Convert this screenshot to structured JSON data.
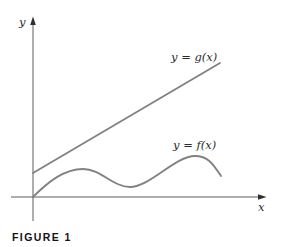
{
  "figure": {
    "caption": "FIGURE 1",
    "labels": {
      "y_axis": "y",
      "x_axis": "x",
      "g_curve": "y = g(x)",
      "f_curve": "y = f(x)"
    },
    "colors": {
      "background": "#ffffff",
      "axis": "#4a4a4a",
      "arrow": "#2e2e2e",
      "curve": "#818181",
      "label_text": "#2b2b2b",
      "caption_text": "#141414"
    },
    "geometry": {
      "x_axis_d": "M 11 197 L 262 197",
      "y_axis_d": "M 33 221 L 33 22",
      "x_arrow_points": "266.5,197 258,194.2 258,199.8",
      "y_arrow_points": "33,16.5 30.2,25 35.8,25",
      "g_line_d": "M 33 173 L 220 63",
      "f_curve_d": "M 33 197 C 48 182 64 169 83 169 C 101 169 113 187 130 187 C 150 187 175 156 195 156 C 208 156 213 164 221 176"
    }
  },
  "chart_data": {
    "type": "line",
    "title": "",
    "xlabel": "x",
    "ylabel": "y",
    "axes_numeric": false,
    "grid": false,
    "legend_position": "inline-annotations",
    "caption": "FIGURE 1",
    "series": [
      {
        "name": "y = g(x)",
        "shape": "straight-line-increasing",
        "points_px": [
          [
            33,
            173
          ],
          [
            220,
            63
          ]
        ]
      },
      {
        "name": "y = f(x)",
        "shape": "wavy-curve",
        "points_px": [
          [
            33,
            197
          ],
          [
            50,
            183
          ],
          [
            83,
            169
          ],
          [
            106,
            178
          ],
          [
            130,
            187
          ],
          [
            160,
            175
          ],
          [
            195,
            156
          ],
          [
            210,
            160
          ],
          [
            221,
            176
          ]
        ],
        "local_maxima_px": [
          [
            83,
            169
          ],
          [
            195,
            156
          ]
        ],
        "local_minima_px": [
          [
            130,
            187
          ]
        ]
      }
    ]
  }
}
